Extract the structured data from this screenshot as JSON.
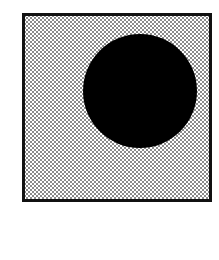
{
  "figure": {
    "frame": {
      "fill_pattern": "stippled-dots",
      "border_color": "#111111",
      "dot_color": "#8a8a8a",
      "background_color": "#ffffff"
    },
    "disc": {
      "color": "#000000",
      "center_x": 140,
      "center_y": 91,
      "radius": 57
    }
  }
}
